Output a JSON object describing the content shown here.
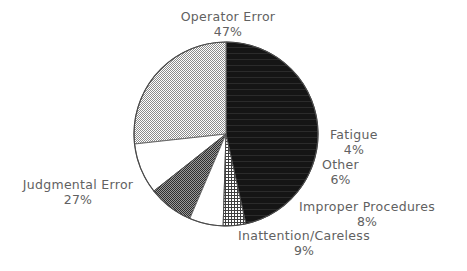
{
  "chart_data": {
    "type": "pie",
    "title": "",
    "subtitle": "",
    "xlabel": "",
    "ylabel": "",
    "legend_position": "none",
    "grid": false,
    "start_angle_deg": 0,
    "direction": "clockwise",
    "categories": [
      "Operator Error",
      "Fatigue",
      "Other",
      "Improper Procedures",
      "Inattention/Careless",
      "Judgmental Error"
    ],
    "values": [
      47,
      4,
      6,
      8,
      9,
      27
    ],
    "value_unit": "%",
    "slices": [
      {
        "label": "Operator Error",
        "value": 47,
        "value_text": "47%",
        "fill": "solid-black",
        "color": "#141414",
        "start_deg": 0,
        "end_deg": 169.2
      },
      {
        "label": "Fatigue",
        "value": 4,
        "value_text": "4%",
        "fill": "grid-mesh",
        "color": "#6e6e6e",
        "start_deg": 169.2,
        "end_deg": 183.6
      },
      {
        "label": "Other",
        "value": 6,
        "value_text": "6%",
        "fill": "white",
        "color": "#ffffff",
        "start_deg": 183.6,
        "end_deg": 205.2
      },
      {
        "label": "Improper Procedures",
        "value": 8,
        "value_text": "8%",
        "fill": "dark-checker",
        "color": "#5a5a5a",
        "start_deg": 205.2,
        "end_deg": 234.0
      },
      {
        "label": "Inattention/Careless",
        "value": 9,
        "value_text": "9%",
        "fill": "white",
        "color": "#ffffff",
        "start_deg": 234.0,
        "end_deg": 266.4
      },
      {
        "label": "Judgmental Error",
        "value": 27,
        "value_text": "27%",
        "fill": "light-checker",
        "color": "#c9c9c9",
        "start_deg": 266.4,
        "end_deg": 360.0
      }
    ],
    "geometry": {
      "center_x": 226,
      "center_y": 134,
      "radius": 92
    },
    "outline_color": "#4a4a4a",
    "text_color": "#616161",
    "background": "#ffffff"
  },
  "labels": {
    "operator_error": {
      "name": "Operator Error",
      "pct": "47%"
    },
    "fatigue": {
      "name": "Fatigue",
      "pct": "4%"
    },
    "other": {
      "name": "Other",
      "pct": "6%"
    },
    "improper": {
      "name": "Improper Procedures",
      "pct": "8%"
    },
    "inattention": {
      "name": "Inattention/Careless",
      "pct": "9%"
    },
    "judgmental": {
      "name": "Judgmental Error",
      "pct": "27%"
    }
  }
}
